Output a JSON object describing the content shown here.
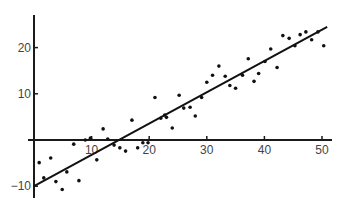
{
  "chart_data": {
    "type": "scatter",
    "title": "",
    "xlabel": "",
    "ylabel": "",
    "xlim": [
      0,
      50
    ],
    "ylim": [
      -10,
      25
    ],
    "grid": false,
    "legend": null,
    "x_ticks": [
      10,
      20,
      30,
      40,
      50
    ],
    "y_ticks": [
      -10,
      10,
      20
    ],
    "x_tick_labels": [
      "10",
      "20",
      "30",
      "40",
      "50"
    ],
    "y_tick_labels": [
      "−10",
      "10",
      "20"
    ],
    "series": [
      {
        "name": "observations",
        "kind": "scatter",
        "points": [
          [
            0.9,
            -4.9
          ],
          [
            1.7,
            -8.2
          ],
          [
            2.9,
            -3.9
          ],
          [
            3.8,
            -9.0
          ],
          [
            4.9,
            -10.7
          ],
          [
            5.7,
            -6.9
          ],
          [
            6.9,
            -0.9
          ],
          [
            7.8,
            -8.8
          ],
          [
            8.9,
            0.0
          ],
          [
            9.8,
            0.4
          ],
          [
            10.9,
            -4.3
          ],
          [
            12.0,
            2.4
          ],
          [
            12.8,
            0.2
          ],
          [
            13.9,
            -1.1
          ],
          [
            14.9,
            -1.7
          ],
          [
            15.9,
            -2.4
          ],
          [
            17.0,
            4.3
          ],
          [
            18.0,
            -1.7
          ],
          [
            18.9,
            -0.6
          ],
          [
            19.8,
            -0.6
          ],
          [
            21.0,
            9.2
          ],
          [
            22.0,
            4.7
          ],
          [
            22.7,
            5.4
          ],
          [
            23.0,
            4.9
          ],
          [
            24.0,
            2.6
          ],
          [
            25.2,
            9.7
          ],
          [
            26.0,
            6.9
          ],
          [
            27.1,
            7.1
          ],
          [
            28.0,
            5.2
          ],
          [
            29.1,
            9.2
          ],
          [
            30.0,
            12.5
          ],
          [
            31.0,
            14.0
          ],
          [
            32.1,
            16.0
          ],
          [
            33.2,
            13.8
          ],
          [
            34.0,
            11.8
          ],
          [
            35.0,
            11.2
          ],
          [
            36.2,
            14.0
          ],
          [
            37.2,
            17.6
          ],
          [
            38.2,
            12.7
          ],
          [
            39.0,
            14.4
          ],
          [
            40.1,
            17.0
          ],
          [
            41.1,
            19.7
          ],
          [
            42.2,
            15.7
          ],
          [
            43.2,
            22.6
          ],
          [
            44.3,
            22.0
          ],
          [
            45.3,
            20.4
          ],
          [
            46.2,
            22.8
          ],
          [
            47.2,
            23.4
          ],
          [
            48.2,
            21.7
          ],
          [
            49.3,
            23.4
          ],
          [
            50.3,
            20.4
          ]
        ]
      },
      {
        "name": "fit line",
        "kind": "line",
        "points": [
          [
            0,
            -10
          ],
          [
            50.9,
            24.5
          ]
        ]
      }
    ]
  },
  "style": {
    "axis_color": "#1a1a1a",
    "point_color": "#111111",
    "line_color": "#111111",
    "label_color": "#444444"
  }
}
